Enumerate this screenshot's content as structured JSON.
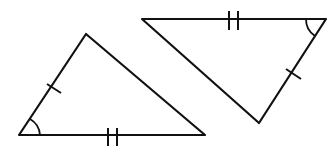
{
  "diagram": {
    "type": "congruent-triangles",
    "background": "#ffffff",
    "stroke_color": "#111111",
    "triangles": [
      {
        "id": "left",
        "vertices": [
          [
            19,
            135
          ],
          [
            86,
            34
          ],
          [
            205,
            135
          ]
        ],
        "single_tick_side": "left-edge",
        "double_tick_side": "bottom-edge",
        "marked_angle": "bottom-left"
      },
      {
        "id": "right",
        "vertices": [
          [
            142,
            19
          ],
          [
            326,
            19
          ],
          [
            259,
            123
          ]
        ],
        "single_tick_side": "right-edge",
        "double_tick_side": "top-edge",
        "marked_angle": "top-right"
      }
    ]
  }
}
